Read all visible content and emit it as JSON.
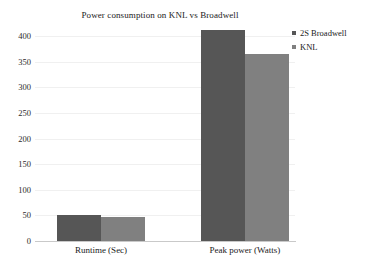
{
  "chart_data": {
    "type": "bar",
    "title": "Power consumption on KNL vs Broadwell",
    "xlabel": "",
    "ylabel": "",
    "categories": [
      "Runtime (Sec)",
      "Peak power (Watts)"
    ],
    "series": [
      {
        "name": "2S Broadwell",
        "values": [
          50,
          412
        ],
        "color": "#565656"
      },
      {
        "name": "KNL",
        "values": [
          47,
          364
        ],
        "color": "#808080"
      }
    ],
    "ylim": [
      0,
      400
    ],
    "yticks": [
      0,
      50,
      100,
      150,
      200,
      250,
      300,
      350,
      400
    ],
    "ytick_labels": [
      "0",
      "50",
      "100",
      "150",
      "200",
      "250",
      "300",
      "350",
      "400"
    ],
    "grid": true,
    "legend_position": "top-right"
  },
  "legend": {
    "items": [
      {
        "label": "2S Broadwell",
        "marker": "square-marker-icon"
      },
      {
        "label": "KNL",
        "marker": "square-marker-icon"
      }
    ]
  }
}
